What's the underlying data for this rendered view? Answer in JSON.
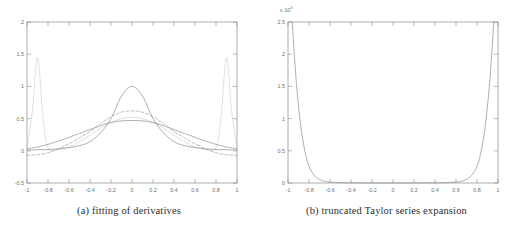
{
  "figure": {
    "background_color": "#ffffff",
    "axis_color": "#8a8a8a",
    "curve_color": "#9a9a9a",
    "text_color": "#2e2e2e"
  },
  "subfigures": [
    {
      "tag": "a",
      "caption": "(a) fitting of derivatives"
    },
    {
      "tag": "b",
      "caption": "(b) truncated Taylor series expansion"
    }
  ],
  "chart_data": [
    {
      "type": "line",
      "title": "",
      "subfigure_label": "(a) fitting of derivatives",
      "xlabel": "",
      "ylabel": "",
      "xlim": [
        -1,
        1
      ],
      "ylim": [
        -0.5,
        2
      ],
      "grid": false,
      "legend": "none",
      "xticks": [
        -1,
        -0.8,
        -0.6,
        -0.4,
        -0.2,
        0,
        0.2,
        0.4,
        0.6,
        0.8,
        1
      ],
      "xticklabels": [
        "-1",
        "-0.8",
        "-0.6",
        "-0.4",
        "-0.2",
        "0",
        "0.2",
        "0.4",
        "0.6",
        "0.8",
        "1"
      ],
      "yticks": [
        -0.5,
        0,
        0.5,
        1,
        1.5,
        2
      ],
      "yticklabels": [
        "-0.5",
        "0",
        "0.5",
        "1",
        "1.5",
        "2"
      ],
      "series": [
        {
          "name": "gaussian-peak",
          "style": "solid",
          "x": [
            -1,
            -0.9,
            -0.8,
            -0.7,
            -0.6,
            -0.5,
            -0.4,
            -0.3,
            -0.2,
            -0.1,
            0,
            0.1,
            0.2,
            0.3,
            0.4,
            0.5,
            0.6,
            0.7,
            0.8,
            0.9,
            1
          ],
          "values": [
            0.01,
            0.015,
            0.02,
            0.03,
            0.05,
            0.08,
            0.14,
            0.28,
            0.5,
            0.85,
            1.0,
            0.85,
            0.5,
            0.28,
            0.14,
            0.08,
            0.05,
            0.03,
            0.02,
            0.015,
            0.01
          ]
        },
        {
          "name": "dashed-fit",
          "style": "dashed",
          "x": [
            -1,
            -0.9,
            -0.8,
            -0.7,
            -0.6,
            -0.5,
            -0.4,
            -0.3,
            -0.2,
            -0.1,
            0,
            0.1,
            0.2,
            0.3,
            0.4,
            0.5,
            0.6,
            0.7,
            0.8,
            0.9,
            1
          ],
          "values": [
            -0.07,
            -0.06,
            -0.03,
            0.03,
            0.11,
            0.2,
            0.3,
            0.42,
            0.53,
            0.6,
            0.62,
            0.6,
            0.53,
            0.42,
            0.3,
            0.2,
            0.11,
            0.03,
            -0.03,
            -0.06,
            -0.07
          ]
        },
        {
          "name": "flat-solid-fit",
          "style": "solid",
          "x": [
            -1,
            -0.9,
            -0.8,
            -0.7,
            -0.6,
            -0.5,
            -0.4,
            -0.3,
            -0.2,
            -0.1,
            0,
            0.1,
            0.2,
            0.3,
            0.4,
            0.5,
            0.6,
            0.7,
            0.8,
            0.9,
            1
          ],
          "values": [
            0.03,
            0.06,
            0.1,
            0.15,
            0.21,
            0.27,
            0.33,
            0.39,
            0.44,
            0.465,
            0.47,
            0.465,
            0.44,
            0.39,
            0.33,
            0.27,
            0.21,
            0.15,
            0.1,
            0.06,
            0.03
          ]
        },
        {
          "name": "dotted-oscillating-fit",
          "style": "dotted",
          "x": [
            -1,
            -0.95,
            -0.9,
            -0.85,
            -0.8,
            -0.7,
            -0.6,
            -0.5,
            -0.4,
            -0.3,
            -0.2,
            -0.1,
            0,
            0.1,
            0.2,
            0.3,
            0.4,
            0.5,
            0.6,
            0.7,
            0.8,
            0.85,
            0.9,
            0.95,
            1
          ],
          "values": [
            0.05,
            0.6,
            1.45,
            0.55,
            0.05,
            0.02,
            0.06,
            0.14,
            0.24,
            0.35,
            0.44,
            0.5,
            0.52,
            0.5,
            0.44,
            0.35,
            0.24,
            0.14,
            0.06,
            0.02,
            0.05,
            0.55,
            1.45,
            0.6,
            0.05
          ]
        }
      ]
    },
    {
      "type": "line",
      "title": "",
      "subfigure_label": "(b) truncated Taylor series expansion",
      "xlabel": "",
      "ylabel": "",
      "y_exponent_label": "x 10",
      "y_exponent_power": "3",
      "xlim": [
        -1,
        1
      ],
      "ylim": [
        0,
        2.5
      ],
      "grid": false,
      "legend": "none",
      "xticks": [
        -1,
        -0.8,
        -0.6,
        -0.4,
        -0.2,
        0,
        0.2,
        0.4,
        0.6,
        0.8,
        1
      ],
      "xticklabels": [
        "-1",
        "-0.8",
        "-0.6",
        "-0.4",
        "-0.2",
        "0",
        "0.2",
        "0.4",
        "0.6",
        "0.8",
        "1"
      ],
      "yticks": [
        0,
        0.5,
        1,
        1.5,
        2,
        2.5
      ],
      "yticklabels": [
        "0",
        "0.5",
        "1",
        "1.5",
        "2",
        "2.5"
      ],
      "series": [
        {
          "name": "truncated-taylor-error",
          "style": "solid",
          "x": [
            -0.96,
            -0.94,
            -0.92,
            -0.9,
            -0.88,
            -0.86,
            -0.84,
            -0.82,
            -0.8,
            -0.78,
            -0.75,
            -0.72,
            -0.68,
            -0.64,
            -0.6,
            -0.5,
            -0.4,
            -0.2,
            0,
            0.2,
            0.4,
            0.5,
            0.6,
            0.64,
            0.68,
            0.72,
            0.75,
            0.78,
            0.8,
            0.82,
            0.84,
            0.86,
            0.88,
            0.9,
            0.92,
            0.94,
            0.96
          ],
          "values": [
            2.5,
            2.0,
            1.55,
            1.2,
            0.9,
            0.68,
            0.5,
            0.36,
            0.26,
            0.19,
            0.12,
            0.075,
            0.04,
            0.025,
            0.015,
            0.005,
            0.002,
            0.001,
            0.001,
            0.001,
            0.002,
            0.005,
            0.015,
            0.025,
            0.04,
            0.075,
            0.12,
            0.19,
            0.26,
            0.36,
            0.5,
            0.68,
            0.9,
            1.2,
            1.55,
            2.0,
            2.5
          ]
        }
      ]
    }
  ]
}
